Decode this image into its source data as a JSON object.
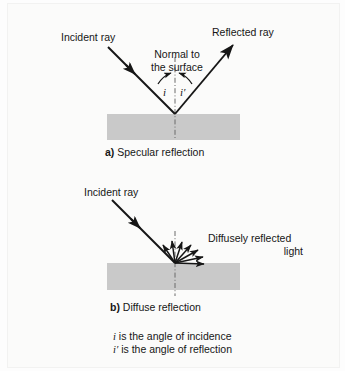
{
  "figure": {
    "background_color": "#fbfbfa",
    "surface_color": "#c9c9c9",
    "ink_color": "#161616"
  },
  "panel_a": {
    "incident_label": "Incident ray",
    "reflected_label": "Reflected ray",
    "normal_label_line1": "Normal to",
    "normal_label_line2": "the surface",
    "angle_incidence": "i",
    "angle_reflection": "i′",
    "caption_marker": "a)",
    "caption_text": "Specular reflection"
  },
  "panel_b": {
    "incident_label": "Incident ray",
    "diffuse_label_line1": "Diffusely reflected",
    "diffuse_label_line2": "light",
    "caption_marker": "b)",
    "caption_text": "Diffuse reflection",
    "diffuse_ray_count": 7
  },
  "legend": {
    "line1_symbol": "i",
    "line1_text": " is the angle of incidence",
    "line2_symbol": "i′",
    "line2_text": " is the angle of reflection"
  }
}
